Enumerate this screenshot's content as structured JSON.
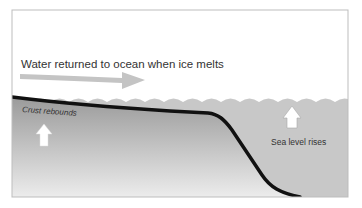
{
  "diagram": {
    "title_label": "Water returned to ocean when ice melts",
    "crust_label": "Crust rebounds",
    "sea_label": "Sea level rises",
    "colors": {
      "frame": "#bdbdbd",
      "sky": "#ffffff",
      "ocean": "#c8c8c8",
      "crust_top": "#9a9a9a",
      "crust_bottom": "#ececec",
      "crust_line": "#111111",
      "flow_arrow": "#c4c4c4",
      "up_arrow": "#ffffff",
      "text": "#333333"
    }
  }
}
